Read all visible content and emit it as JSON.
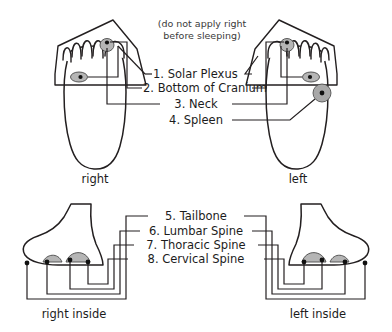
{
  "note": {
    "line1": "(do not apply right",
    "line2": "before sleeping)"
  },
  "top_section": {
    "feet": [
      {
        "id": "right-sole",
        "label": "right"
      },
      {
        "id": "left-sole",
        "label": "left"
      }
    ],
    "points": [
      {
        "number": "1.",
        "name": "Solar Plexus",
        "label": "1. Solar Plexus"
      },
      {
        "number": "2.",
        "name": "Bottom of Cranium",
        "label": "2. Bottom of Cranium"
      },
      {
        "number": "3.",
        "name": "Neck",
        "label": "3. Neck"
      },
      {
        "number": "4.",
        "name": "Spleen",
        "label": "4. Spleen"
      }
    ]
  },
  "bottom_section": {
    "feet": [
      {
        "id": "right-inside",
        "label": "right inside"
      },
      {
        "id": "left-inside",
        "label": "left inside"
      }
    ],
    "points": [
      {
        "number": "5.",
        "name": "Tailbone",
        "label": "5. Tailbone"
      },
      {
        "number": "6.",
        "name": "Lumbar Spine",
        "label": "6. Lumbar Spine"
      },
      {
        "number": "7.",
        "name": "Thoracic Spine",
        "label": "7. Thoracic Spine"
      },
      {
        "number": "8.",
        "name": "Cervical Spine",
        "label": "8. Cervical Spine"
      }
    ]
  },
  "colors": {
    "ink": "#231f20",
    "marker_fill": "#b5b5b5",
    "dot": "#111111",
    "background": "#ffffff"
  }
}
